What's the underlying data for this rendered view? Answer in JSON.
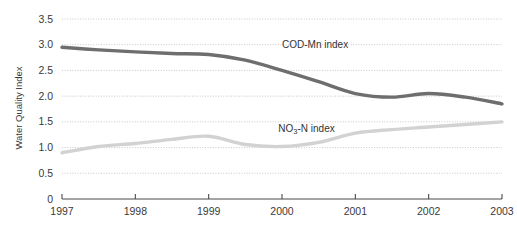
{
  "chart_data": {
    "type": "line",
    "title": "",
    "xlabel": "",
    "ylabel": "Water Quality Index",
    "xlim": [
      1997,
      2003
    ],
    "ylim": [
      0,
      3.5
    ],
    "grid": true,
    "legend_position": "inline-annotation",
    "x_tick_labels": [
      "1997",
      "1998",
      "1999",
      "2000",
      "2001",
      "2002",
      "2003"
    ],
    "y_tick_labels": [
      "0",
      "0.5",
      "1.0",
      "1.5",
      "2.0",
      "2.5",
      "3.0",
      "3.5"
    ],
    "y_tick_values": [
      0,
      0.5,
      1.0,
      1.5,
      2.0,
      2.5,
      3.0,
      3.5
    ],
    "x": [
      1997,
      1997.5,
      1998,
      1998.5,
      1999,
      1999.5,
      2000,
      2000.5,
      2001,
      2001.5,
      2002,
      2002.5,
      2003
    ],
    "series": [
      {
        "name": "COD-Mn index",
        "color": "#6e6e6e",
        "label_x": 2000.0,
        "label_y": 2.93,
        "values": [
          2.95,
          2.9,
          2.86,
          2.83,
          2.81,
          2.7,
          2.5,
          2.28,
          2.05,
          1.98,
          2.05,
          1.98,
          1.85
        ]
      },
      {
        "name": "NO3-N index",
        "name_parts": {
          "prefix": "NO",
          "sub": "3",
          "suffix": "-N index"
        },
        "color": "#d2d2d2",
        "label_x": 1999.95,
        "label_y": 1.3,
        "values": [
          0.9,
          1.02,
          1.08,
          1.16,
          1.22,
          1.06,
          1.02,
          1.1,
          1.28,
          1.35,
          1.4,
          1.45,
          1.5
        ]
      }
    ]
  },
  "axis": {
    "y_title": "Water Quality Index"
  },
  "colors": {
    "cod_line": "#6e6e6e",
    "no3_line": "#d2d2d2",
    "gridline": "#c8c8c8",
    "axis": "#4a4a4a",
    "text": "#3a3a3a",
    "background": "#ffffff"
  }
}
